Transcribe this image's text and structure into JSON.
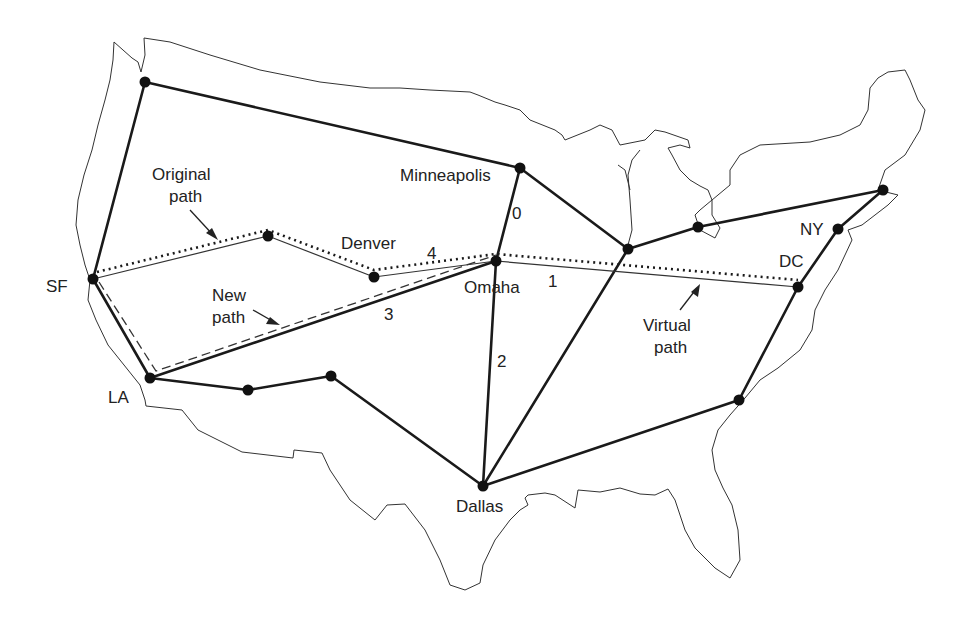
{
  "diagram": {
    "cities": {
      "sf": "SF",
      "la": "LA",
      "denver": "Denver",
      "omaha": "Omaha",
      "minneapolis": "Minneapolis",
      "dallas": "Dallas",
      "ny": "NY",
      "dc": "DC"
    },
    "link_labels": {
      "l0": "0",
      "l1": "1",
      "l2": "2",
      "l3": "3",
      "l4": "4"
    },
    "annotations": {
      "original_path_line1": "Original",
      "original_path_line2": "path",
      "new_path_line1": "New",
      "new_path_line2": "path",
      "virtual_path_line1": "Virtual",
      "virtual_path_line2": "path"
    },
    "colors": {
      "line": "#1a1a1a",
      "background": "#ffffff"
    }
  }
}
